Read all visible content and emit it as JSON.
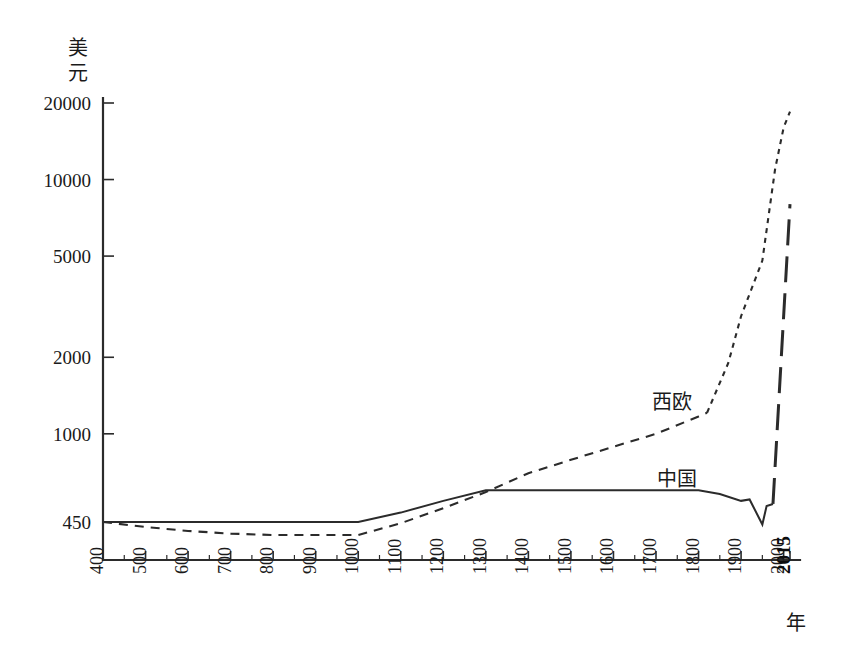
{
  "chart_data": {
    "type": "line",
    "title": "",
    "subtitle": "",
    "xlabel": "年",
    "ylabel": "美元",
    "ylabel_chars": [
      "美",
      "元"
    ],
    "yscale": "log",
    "ylim": [
      380,
      22000
    ],
    "xlim": [
      400,
      2015
    ],
    "grid": false,
    "legend_position": "inline-annotation",
    "y_ticks": [
      450,
      1000,
      2000,
      5000,
      10000,
      20000
    ],
    "y_tick_labels": [
      "450",
      "1000",
      "2000",
      "5000",
      "10000",
      "20000"
    ],
    "x_ticks": [
      400,
      500,
      600,
      700,
      800,
      900,
      1000,
      1100,
      1200,
      1300,
      1400,
      1500,
      1600,
      1700,
      1800,
      1900,
      2000,
      2015
    ],
    "x_tick_labels": [
      "400",
      "500",
      "600",
      "700",
      "800",
      "900",
      "1000",
      "1100",
      "1200",
      "1300",
      "1400",
      "1500",
      "1600",
      "1700",
      "1800",
      "1900",
      "2000",
      "2015"
    ],
    "x_tick_bold": [
      "2015"
    ],
    "x_minor_ticks": [
      450,
      550,
      650,
      750,
      850,
      950,
      1050,
      1150,
      1250,
      1350,
      1450,
      1550,
      1650,
      1750,
      1850,
      1950
    ],
    "series": [
      {
        "name": "中国",
        "style": "solid",
        "annotation": "中国",
        "annotation_x": 1830,
        "annotation_y": 700,
        "x": [
          400,
          500,
          600,
          700,
          800,
          900,
          1000,
          1100,
          1200,
          1300,
          1400,
          1500,
          1600,
          1700,
          1800,
          1850,
          1900,
          1920,
          1950,
          1960,
          1975,
          2015
        ],
        "values": [
          450,
          450,
          450,
          450,
          450,
          450,
          450,
          490,
          545,
          600,
          600,
          600,
          600,
          600,
          600,
          580,
          545,
          552,
          440,
          520,
          530,
          8000
        ]
      },
      {
        "name": "西欧",
        "style": "dashed",
        "annotation": "西欧",
        "annotation_x": 1700,
        "annotation_y": 1180,
        "x": [
          400,
          500,
          600,
          700,
          800,
          900,
          1000,
          1100,
          1200,
          1300,
          1400,
          1500,
          1600,
          1700,
          1800,
          1820,
          1870,
          1900,
          1950,
          1980,
          2000,
          2015
        ],
        "values": [
          450,
          430,
          415,
          405,
          400,
          400,
          400,
          445,
          510,
          590,
          700,
          790,
          890,
          1000,
          1170,
          1210,
          1900,
          2900,
          4800,
          11000,
          16000,
          18500
        ]
      }
    ]
  },
  "axis_unit_y": "美元",
  "axis_unit_x": "年"
}
